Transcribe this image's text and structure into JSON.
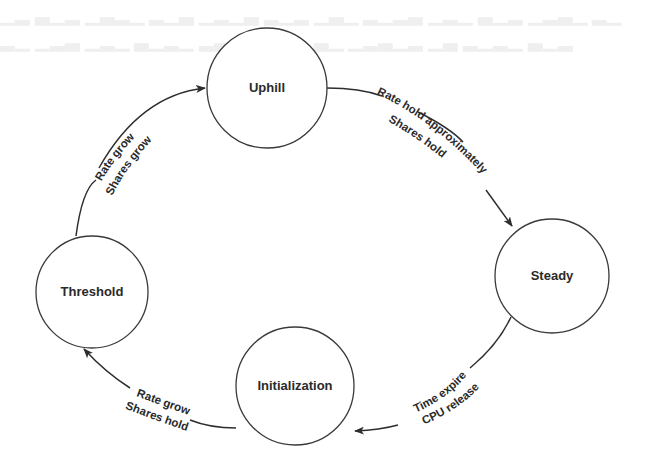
{
  "diagram": {
    "type": "state-cycle",
    "nodes": [
      {
        "id": "uphill",
        "label": "Uphill"
      },
      {
        "id": "steady",
        "label": "Steady"
      },
      {
        "id": "initialization",
        "label": "Initialization"
      },
      {
        "id": "threshold",
        "label": "Threshold"
      }
    ],
    "edges": [
      {
        "from": "uphill",
        "to": "steady",
        "line1": "Rate hold approximately",
        "line2": "Shares hold"
      },
      {
        "from": "steady",
        "to": "initialization",
        "line1": "Time expire",
        "line2": "CPU release"
      },
      {
        "from": "initialization",
        "to": "threshold",
        "line1": "Rate grow",
        "line2": "Shares hold"
      },
      {
        "from": "threshold",
        "to": "uphill",
        "line1": "Rate grow",
        "line2": "Shares grow"
      }
    ]
  },
  "colors": {
    "stroke": "#2e2e2e",
    "background": "#ffffff",
    "bleed_text": "#efefef"
  }
}
